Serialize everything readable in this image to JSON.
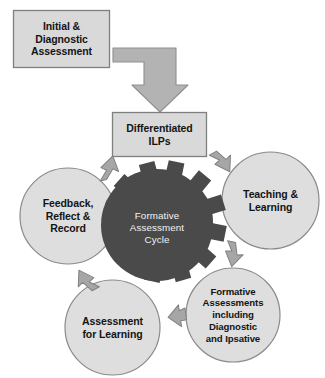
{
  "diagram": {
    "title": "Formative Assessment Cycle",
    "colors": {
      "background": "#ffffff",
      "box_fill": "#d9d9d9",
      "box_stroke": "#7f7f7f",
      "circle_fill": "#dedede",
      "circle_stroke": "#8a8a8a",
      "gear_fill": "#4a4a4a",
      "gear_text": "#f2f2f2",
      "arrow_fill": "#a6a6a6",
      "arrow_stroke": "#808080",
      "text": "#141414"
    },
    "boxes": [
      {
        "id": "initial-assessment",
        "label": "Initial &\nDiagnostic\nAssessment"
      },
      {
        "id": "differentiated-ilps",
        "label": "Differentiated\nILPs"
      }
    ],
    "hub": {
      "id": "formative-assessment-cycle",
      "label": "Formative\nAssessment\nCycle",
      "teeth": 10
    },
    "cycle_nodes": [
      {
        "id": "teaching-learning",
        "label": "Teaching &\nLearning",
        "position": "right"
      },
      {
        "id": "formative-assessments",
        "label": "Formative\nAssessments\nincluding\nDiagnostic\nand Ipsative",
        "position": "bottom-right"
      },
      {
        "id": "assessment-for-learning",
        "label": "Assessment\nfor Learning",
        "position": "bottom-left"
      },
      {
        "id": "feedback-reflect-record",
        "label": "Feedback,\nReflect &\nRecord",
        "position": "left"
      }
    ],
    "connectors": [
      {
        "id": "elbow-initial-to-ilps",
        "type": "elbow-arrow",
        "direction": "down",
        "from": "initial-assessment",
        "to": "differentiated-ilps"
      },
      {
        "id": "cycle-arrow-ilps-to-teaching",
        "type": "chevron-arrow",
        "direction": "down-right"
      },
      {
        "id": "cycle-arrow-teaching-to-formative",
        "type": "chevron-arrow",
        "direction": "down-right"
      },
      {
        "id": "cycle-arrow-formative-to-assessment",
        "type": "chevron-arrow",
        "direction": "left"
      },
      {
        "id": "cycle-arrow-assessment-to-feedback",
        "type": "chevron-arrow",
        "direction": "up-left"
      },
      {
        "id": "cycle-arrow-feedback-to-ilps",
        "type": "chevron-arrow",
        "direction": "up-right"
      }
    ]
  }
}
